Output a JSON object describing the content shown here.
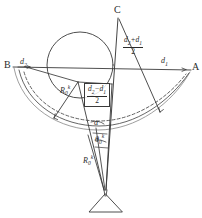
{
  "figure": {
    "type": "geometry-diagram",
    "style": "hand-drawn technical sketch",
    "background": "#ffffff",
    "stroke_color": "#3a3a3a",
    "width": 202,
    "height": 218
  },
  "points": {
    "C": {
      "label": "C",
      "x": 118,
      "y": 14
    },
    "B": {
      "label": "B",
      "x": 10,
      "y": 67
    },
    "A": {
      "label": "A",
      "x": 191,
      "y": 70
    }
  },
  "labels": {
    "d2": {
      "text": "d",
      "sub": "2"
    },
    "d1": {
      "text": "d",
      "sub": "1"
    },
    "R0k_upper": {
      "text": "R",
      "sub": "0",
      "sup": "k"
    },
    "R0k_lower": {
      "text": "R",
      "sub": "0",
      "sup": "k"
    },
    "alpha": {
      "text": "α"
    },
    "theta0k": {
      "text": "θ",
      "sub": "0",
      "sup": "k"
    }
  },
  "fractions": {
    "sum_half": {
      "numerator": {
        "a": "d",
        "a_sub": "2",
        "op": "+",
        "b": "d",
        "b_sub": "1"
      },
      "denominator": "2",
      "boxed": false
    },
    "diff_half": {
      "numerator": {
        "a": "d",
        "a_sub": "2",
        "op": "−",
        "b": "d",
        "b_sub": "1"
      },
      "denominator": "2",
      "boxed": true
    }
  },
  "elements": {
    "circle": {
      "cx": 80,
      "cy": 65,
      "r": 33
    },
    "solid_arc": "dish outline from B to A",
    "dashed_arc": "inner dashed dish outline",
    "pivot_support": "triangular base at bottom center",
    "chord_BA": "straight line from B to A",
    "ray_C": "line from C down to pivot"
  }
}
